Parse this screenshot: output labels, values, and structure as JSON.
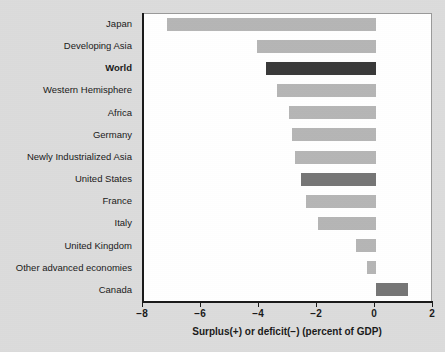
{
  "chart_data": {
    "type": "bar",
    "orientation": "horizontal",
    "title": "",
    "xlabel": "Surplus(+) or deficit(−) (percent of GDP)",
    "ylabel": "",
    "xlim": [
      -8,
      2
    ],
    "xticks": [
      "−8",
      "−6",
      "−4",
      "−2",
      "0",
      "2"
    ],
    "xtick_values": [
      -8,
      -6,
      -4,
      -2,
      0,
      2
    ],
    "grid": false,
    "legend": "none",
    "categories": [
      "Japan",
      "Developing Asia",
      "World",
      "Western Hemisphere",
      "Africa",
      "Germany",
      "Newly Industrialized Asia",
      "United States",
      "France",
      "Italy",
      "United Kingdom",
      "Other advanced economies",
      "Canada"
    ],
    "values": [
      -7.2,
      -4.1,
      -3.8,
      -3.4,
      -3.0,
      -2.9,
      -2.8,
      -2.6,
      -2.4,
      -2.0,
      -0.7,
      -0.3,
      1.1
    ],
    "bar_styles": [
      "light",
      "light",
      "dark",
      "light",
      "light",
      "light",
      "light",
      "mid",
      "light",
      "light",
      "light",
      "light",
      "mid"
    ],
    "emphasized_categories": [
      "World"
    ]
  },
  "colors": {
    "page_background": "#dcdcdc",
    "plot_background": "#ffffff",
    "axis": "#1a1a1a",
    "bar_light": "#b6b6b6",
    "bar_mid": "#767676",
    "bar_dark": "#3a3a3a",
    "text": "#1a1a1a"
  }
}
